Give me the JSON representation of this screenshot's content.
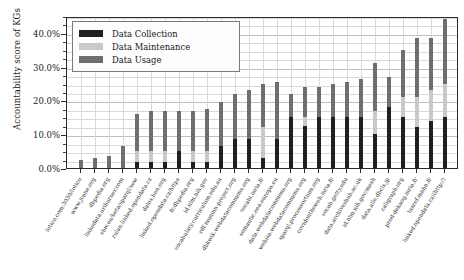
{
  "chart_data": {
    "type": "bar",
    "stacked": true,
    "title": "",
    "xlabel": "",
    "ylabel": "Accountability score of KGs",
    "ylim": [
      0,
      45
    ],
    "ytick_labels": [
      "0.0%",
      "10.0%",
      "20.0%",
      "30.0%",
      "40.0%"
    ],
    "ytick_values": [
      0,
      10,
      20,
      30,
      40
    ],
    "yminor_step": 2.5,
    "grid": true,
    "legend_position": "upper left",
    "legend": [
      "Data Collection",
      "Data Maintenance",
      "Data Usage"
    ],
    "colors": {
      "Data Collection": "#231f20",
      "Data Maintenance": "#c9c9c9",
      "Data Usage": "#6e6e6e"
    },
    "categories": [
      "lotico.com:3030/lotico",
      "www.jcane.org",
      "dbpedia.org",
      "linkedata.uriburner.com",
      "sbw.eu/beta/sparql/sew",
      "rulan.linked.opendata.cz",
      "dalos.ben.org",
      "linked.opendata.cz/https",
      "fr.dbpedia.org",
      "id.nlm.nih.gov",
      "vocabulary.curriculum.edu.au",
      "rdf.muninn-project.org",
      "dbkwik.webdatacommons.org",
      "vocabi.inria.fr",
      "semantic.eea.europa.eu",
      "data.webdatacommons.org",
      "webisa.webdatacommons.org",
      "sparql.proconsortium.org",
      "covidontheweb.inria.fr",
      "vocab.getty.edu",
      "data.archiveshub.ac.uk",
      "id.nlm.nih.gov/mesh",
      "data.alle.dbcls.jp",
      "caligraph.org",
      "prod-dekaog.inria.fr",
      "taxref.mnhn.fr",
      "linked.opendata.cz|(http:/)"
    ],
    "series": [
      {
        "name": "Data Collection",
        "values": [
          0.0,
          0.0,
          0.0,
          0.0,
          1.8,
          1.8,
          1.8,
          5.0,
          1.8,
          1.8,
          6.5,
          8.5,
          8.5,
          3.0,
          8.5,
          15.0,
          12.5,
          15.0,
          15.0,
          15.0,
          15.0,
          10.0,
          18.0,
          15.0,
          12.0,
          14.0,
          15.0
        ]
      },
      {
        "name": "Data Maintenance",
        "values": [
          0.0,
          0.0,
          0.0,
          0.0,
          3.2,
          3.2,
          3.2,
          0.0,
          3.2,
          3.2,
          0.0,
          0.0,
          0.0,
          9.0,
          0.0,
          0.0,
          2.5,
          0.0,
          0.0,
          0.0,
          0.0,
          7.0,
          0.0,
          6.0,
          9.0,
          9.0,
          10.0
        ]
      },
      {
        "name": "Data Usage",
        "values": [
          2.4,
          3.0,
          3.5,
          6.5,
          11.0,
          12.0,
          12.0,
          12.0,
          12.0,
          12.5,
          13.0,
          13.5,
          14.5,
          13.0,
          17.0,
          7.0,
          9.0,
          9.0,
          10.0,
          10.5,
          11.5,
          14.0,
          9.0,
          14.0,
          17.5,
          15.5,
          19.0
        ]
      }
    ],
    "totals": [
      2.4,
      3.0,
      3.5,
      6.5,
      16.0,
      17.0,
      17.0,
      17.0,
      17.0,
      17.5,
      19.5,
      22.0,
      23.0,
      25.0,
      25.5,
      22.0,
      24.0,
      24.0,
      25.0,
      25.5,
      26.5,
      31.0,
      27.0,
      35.0,
      38.5,
      38.5,
      44.0
    ]
  }
}
